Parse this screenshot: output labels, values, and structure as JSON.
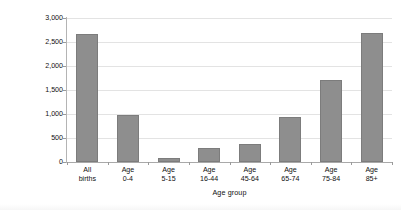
{
  "chart_data": {
    "type": "bar",
    "title": "",
    "subtitle": "",
    "xlabel": "Age group",
    "ylabel": "Expenditure (£s)",
    "categories": [
      "All births",
      "Age 0-4",
      "Age 5-15",
      "Age 16-44",
      "Age 45-64",
      "Age 65-74",
      "Age 75-84",
      "Age 85+"
    ],
    "category_lines": [
      [
        "All",
        "births"
      ],
      [
        "Age",
        "0-4"
      ],
      [
        "Age",
        "5-15"
      ],
      [
        "Age",
        "16-44"
      ],
      [
        "Age",
        "45-64"
      ],
      [
        "Age",
        "65-74"
      ],
      [
        "Age",
        "75-84"
      ],
      [
        "Age",
        "85+"
      ]
    ],
    "values": [
      2670,
      980,
      75,
      300,
      365,
      930,
      1700,
      2680
    ],
    "ylim": [
      0,
      3000
    ],
    "ytick_values": [
      3000,
      2500,
      2000,
      1500,
      1000,
      500,
      0
    ],
    "ytick_labels": [
      "3,000",
      "2,500",
      "2,000",
      "1,500",
      "1,000",
      "500",
      "0"
    ],
    "grid": "horizontal",
    "legend": "none",
    "bar_color": "#8e8e8e",
    "axis_color": "#b4b4b4",
    "grid_color": "#e3e3e3",
    "text_color": "#111111"
  }
}
